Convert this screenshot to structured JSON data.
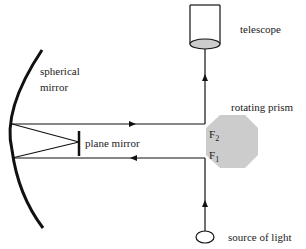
{
  "labels": {
    "telescope": "telescope",
    "spherical_mirror_line1": "spherical",
    "spherical_mirror_line2": "mirror",
    "rotating_prism": "rotating prism",
    "plane_mirror": "plane mirror",
    "face2_letter": "F",
    "face2_sub": "2",
    "face1_letter": "F",
    "face1_sub": "1",
    "source": "source of light"
  },
  "colors": {
    "line": "#111111",
    "prism_fill": "#cccccc",
    "lens_fill": "#cccccc"
  }
}
